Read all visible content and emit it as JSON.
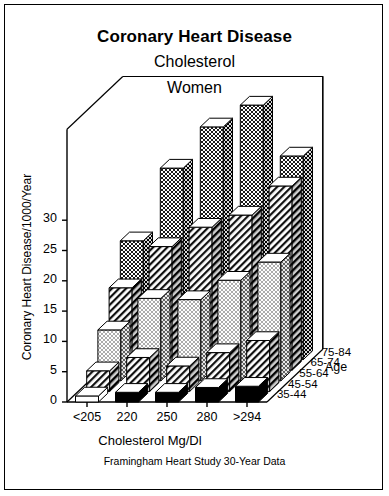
{
  "title": {
    "line1": "Coronary Heart Disease",
    "line2": "Cholesterol",
    "line3": "Women"
  },
  "footer": "Framingham Heart Study  30-Year Data",
  "axis": {
    "y_label": "Coronary Heart Disease/1000/Year",
    "x_label": "Cholesterol Mg/Dl",
    "z_label": "Age"
  },
  "chart_data": {
    "type": "bar",
    "subtype": "3d-grouped-bar",
    "title": "Coronary Heart Disease Cholesterol Women",
    "xlabel": "Cholesterol Mg/Dl",
    "ylabel": "Coronary Heart Disease/1000/Year",
    "zlabel": "Age",
    "categories": [
      "<205",
      "220",
      "250",
      "280",
      ">294"
    ],
    "yticks": [
      0,
      5,
      10,
      15,
      20,
      25,
      30
    ],
    "ylim": [
      0,
      45
    ],
    "grid": false,
    "legend": "depth-axis",
    "series": [
      {
        "name": "35-44",
        "fill": "solid-white",
        "values": [
          1.0,
          1.6,
          1.6,
          2.4,
          2.6
        ]
      },
      {
        "name": "45-54",
        "fill": "diagonal-hatch",
        "values": [
          3.4,
          5.6,
          4.2,
          6.4,
          8.4
        ]
      },
      {
        "name": "55-64",
        "fill": "fine-dots",
        "values": [
          8.4,
          13.6,
          13.4,
          16.6,
          19.6
        ]
      },
      {
        "name": "65-74",
        "fill": "diagonal-hatch",
        "values": [
          13.6,
          20.4,
          23.6,
          25.6,
          30.4
        ]
      },
      {
        "name": "75-84",
        "fill": "dense-dots",
        "values": [
          19.6,
          31.6,
          38.4,
          42.0,
          33.6
        ]
      }
    ]
  }
}
